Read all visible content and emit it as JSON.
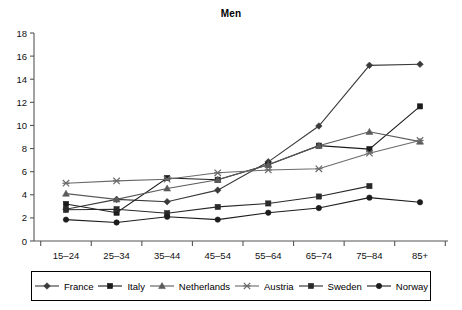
{
  "chart_data": {
    "type": "line",
    "title": "Men",
    "xlabel": "",
    "ylabel": "",
    "ylim": [
      0,
      18
    ],
    "yticks": [
      0,
      2,
      4,
      6,
      8,
      10,
      12,
      14,
      16,
      18
    ],
    "grid": false,
    "legend_position": "bottom",
    "categories": [
      "15–24",
      "25–34",
      "35–44",
      "45–54",
      "55–64",
      "65–74",
      "75–84",
      "85+"
    ],
    "series": [
      {
        "name": "France",
        "marker": "diamond",
        "color": "#3a3a3a",
        "values": [
          2.75,
          3.6,
          3.4,
          4.4,
          6.85,
          9.95,
          15.2,
          15.3
        ]
      },
      {
        "name": "Italy",
        "marker": "square",
        "color": "#1c1c1c",
        "values": [
          3.2,
          2.45,
          5.45,
          5.3,
          6.6,
          8.25,
          7.95,
          11.65
        ]
      },
      {
        "name": "Netherlands",
        "marker": "triangle",
        "color": "#5a5a5a",
        "values": [
          4.1,
          3.6,
          4.55,
          5.3,
          6.6,
          8.25,
          9.45,
          8.6
        ]
      },
      {
        "name": "Austria",
        "marker": "x-dash",
        "color": "#6a6a6a",
        "values": [
          5.0,
          5.2,
          5.35,
          5.9,
          6.15,
          6.25,
          7.6,
          8.7
        ]
      },
      {
        "name": "Sweden",
        "marker": "square",
        "color": "#2a2a2a",
        "values": [
          2.7,
          2.75,
          2.4,
          2.95,
          3.25,
          3.85,
          4.75,
          null
        ]
      },
      {
        "name": "Norway",
        "marker": "circle",
        "color": "#1c1c1c",
        "values": [
          1.85,
          1.6,
          2.1,
          1.85,
          2.45,
          2.85,
          3.75,
          3.35
        ]
      }
    ]
  },
  "legend": {
    "items": [
      {
        "label": "France"
      },
      {
        "label": "Italy"
      },
      {
        "label": "Netherlands"
      },
      {
        "label": "Austria"
      },
      {
        "label": "Sweden"
      },
      {
        "label": "Norway"
      }
    ]
  }
}
